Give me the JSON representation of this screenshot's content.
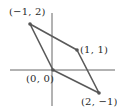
{
  "diagram": {
    "title": "",
    "type": "parallelogram-on-axes",
    "colors": {
      "axis": "#555555",
      "edge": "#5a5a5a",
      "point": "#555555",
      "text": "#2a2a2a"
    },
    "axes": {
      "x_axis": {
        "x1": 10,
        "y1": 70,
        "x2": 115,
        "y2": 70
      },
      "y_axis": {
        "x1": 52,
        "y1": 13,
        "x2": 52,
        "y2": 106
      }
    },
    "vertices": [
      {
        "name": "A",
        "label": "(−1, 2)",
        "px": 30,
        "py": 24,
        "label_x": 9,
        "label_y": 7
      },
      {
        "name": "B",
        "label": "(1, 1)",
        "px": 77,
        "py": 50,
        "label_x": 80,
        "label_y": 45
      },
      {
        "name": "C",
        "label": "(2, −1)",
        "px": 99,
        "py": 93,
        "label_x": 81,
        "label_y": 97
      },
      {
        "name": "O",
        "label": "(0, 0)",
        "px": 53,
        "py": 70,
        "label_x": 26,
        "label_y": 74
      }
    ],
    "edges": [
      [
        "A",
        "B"
      ],
      [
        "B",
        "C"
      ],
      [
        "C",
        "O"
      ],
      [
        "O",
        "A"
      ]
    ]
  }
}
